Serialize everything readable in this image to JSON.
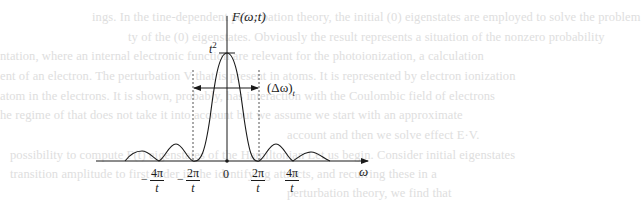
{
  "figure": {
    "y_axis_label": "F(ω;t)",
    "peak_label": "t",
    "peak_label_sup": "2",
    "width_label": "(Δω)",
    "width_label_sub": "t",
    "x_axis_label": "ω",
    "origin_label": "0",
    "ticks": [
      {
        "sign": "−",
        "num": "4π",
        "den": "t",
        "x": 159
      },
      {
        "sign": "−",
        "num": "2π",
        "den": "t",
        "x": 193
      },
      {
        "sign": "",
        "num": "2π",
        "den": "t",
        "x": 259
      },
      {
        "sign": "",
        "num": "4π",
        "den": "t",
        "x": 293
      }
    ],
    "colors": {
      "ink": "#1a1a1a",
      "dashed": "#555555",
      "bleed_text": "#dedede"
    }
  },
  "chart_data": {
    "type": "line",
    "title": "",
    "xlabel": "ω",
    "ylabel": "F(ω;t)",
    "function": "F(ω;t) = sin²(ωt/2)/(ω/2)²",
    "peak": {
      "x": 0,
      "y": "t²"
    },
    "zeros": [
      "−4π/t",
      "−2π/t",
      "2π/t",
      "4π/t"
    ],
    "x_ticks": [
      "−4π/t",
      "−2π/t",
      "0",
      "2π/t",
      "4π/t"
    ],
    "annotations": [
      "t²",
      "(Δω)_t"
    ],
    "width_marker": {
      "from": "−2π/t",
      "to": "2π/t",
      "label": "(Δω)_t"
    },
    "grid": false
  },
  "background_bleed": {
    "lines": [
      {
        "y": 10,
        "x": 92,
        "text": "ings. In the tine-dependent perturbation theory, the initial (0) eigenstates are employed to solve the problem"
      },
      {
        "y": 30,
        "x": 128,
        "text": "ty of the (0) eigenstates. Obviously the result represents a situation of the nonzero probability"
      },
      {
        "y": 49,
        "x": 0,
        "text": "ntation, where an internal electronic function are relevant for the photoionization, a calculation"
      },
      {
        "y": 69,
        "x": 0,
        "text": "ent of an electron. The perturbation V that is present in atoms. It is represented by electron ionization"
      },
      {
        "y": 89,
        "x": 0,
        "text": "atom in the electrons. It is shown, probably, has interaction with the Coulombic field of electrons"
      },
      {
        "y": 108,
        "x": 0,
        "text": "he regime of that does not take it into account but we assume we start with an approximate"
      },
      {
        "y": 128,
        "x": 287,
        "text": "account and then we solve effect E·V."
      },
      {
        "y": 148,
        "x": 10,
        "text": "possibility to compute F(t) eigenstates of the Hamiltonian    Let us begin. Consider initial eigenstates"
      },
      {
        "y": 167,
        "x": 10,
        "text": "transition amplitude to first order in the   identifying attracts, and recurring these in a"
      },
      {
        "y": 186,
        "x": 287,
        "text": "perturbation theory, we find that"
      }
    ]
  }
}
